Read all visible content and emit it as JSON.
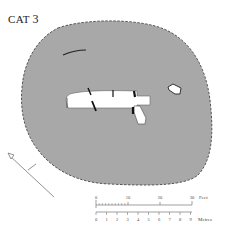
{
  "title": {
    "prefix": "CAT",
    "number": "3"
  },
  "plan": {
    "fill_color": "#a8a8a8",
    "outline_style": "dashed",
    "opening_color": "#ffffff"
  },
  "north_arrow": {
    "icon": "north-arrow-icon"
  },
  "scale": {
    "feet": {
      "unit_label": "Feet",
      "ticks": [
        "0",
        "10",
        "20",
        "30"
      ]
    },
    "metres": {
      "unit_label": "Metres",
      "ticks": [
        "0",
        "1",
        "2",
        "3",
        "4",
        "5",
        "6",
        "7",
        "8",
        "9"
      ]
    }
  }
}
